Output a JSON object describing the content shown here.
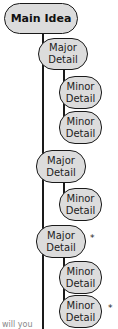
{
  "diagram": {
    "type": "hierarchy-outline",
    "main": {
      "label": "Main Idea"
    },
    "nodes": [
      {
        "label_line1": "Major",
        "label_line2": "Detail",
        "level": "major",
        "marked": false
      },
      {
        "label_line1": "Minor",
        "label_line2": "Detail",
        "level": "minor",
        "marked": false
      },
      {
        "label_line1": "Minor",
        "label_line2": "Detail",
        "level": "minor",
        "marked": false
      },
      {
        "label_line1": "Major",
        "label_line2": "Detail",
        "level": "major",
        "marked": false
      },
      {
        "label_line1": "Minor",
        "label_line2": "Detail",
        "level": "minor",
        "marked": false
      },
      {
        "label_line1": "Major",
        "label_line2": "Detail",
        "level": "major",
        "marked": true
      },
      {
        "label_line1": "Minor",
        "label_line2": "Detail",
        "level": "minor",
        "marked": false
      },
      {
        "label_line1": "Minor",
        "label_line2": "Detail",
        "level": "minor",
        "marked": true
      }
    ],
    "marker": "*",
    "cut_text": "will you"
  }
}
